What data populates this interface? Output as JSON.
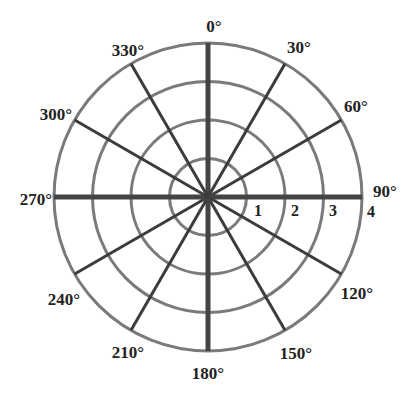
{
  "diagram": {
    "type": "polar-grid",
    "center": {
      "x": 208,
      "y": 197
    },
    "ring_spacing_px": 38.5,
    "rings": [
      1,
      2,
      3,
      4
    ],
    "ring_labels": [
      {
        "text": "1",
        "x": 258,
        "y": 216
      },
      {
        "text": "2",
        "x": 295,
        "y": 216
      },
      {
        "text": "3",
        "x": 333,
        "y": 216
      },
      {
        "text": "4",
        "x": 371,
        "y": 217
      }
    ],
    "angles": [
      0,
      30,
      60,
      90,
      120,
      150,
      180,
      210,
      240,
      270,
      300,
      330
    ],
    "angle_labels": [
      {
        "text": "0°",
        "x": 214,
        "y": 32,
        "anchor": "middle"
      },
      {
        "text": "30°",
        "x": 299,
        "y": 53,
        "anchor": "middle"
      },
      {
        "text": "60°",
        "x": 356,
        "y": 112,
        "anchor": "middle"
      },
      {
        "text": "90°",
        "x": 385,
        "y": 197,
        "anchor": "middle"
      },
      {
        "text": "120°",
        "x": 357,
        "y": 299,
        "anchor": "middle"
      },
      {
        "text": "150°",
        "x": 296,
        "y": 359,
        "anchor": "middle"
      },
      {
        "text": "180°",
        "x": 208,
        "y": 379,
        "anchor": "middle"
      },
      {
        "text": "210°",
        "x": 128,
        "y": 358,
        "anchor": "middle"
      },
      {
        "text": "240°",
        "x": 64,
        "y": 305,
        "anchor": "middle"
      },
      {
        "text": "270°",
        "x": 36,
        "y": 205,
        "anchor": "middle"
      },
      {
        "text": "300°",
        "x": 56,
        "y": 120,
        "anchor": "middle"
      },
      {
        "text": "330°",
        "x": 128,
        "y": 56,
        "anchor": "middle"
      }
    ],
    "colors": {
      "ring": "#7a7a7a",
      "spoke": "#3c3c3c",
      "axis": "#444444",
      "text": "#222222",
      "background": "#ffffff"
    }
  }
}
